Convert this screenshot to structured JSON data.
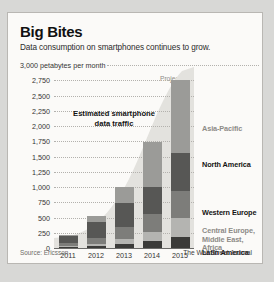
{
  "card": {
    "title": "Big Bites",
    "subtitle": "Data consumption on smartphones continues to grow.",
    "source": "Source: Ericsson",
    "credit": "The Wall Street Journal"
  },
  "annotations": {
    "estimate_note": "Estimated\nsmartphone data\ntraffic",
    "projected": "Projected",
    "axis_unit": "3,000 petabytes per month"
  },
  "colors": {
    "asia_pacific": "#9b9b98",
    "north_america": "#575755",
    "western_europe": "#7d7d7a",
    "cemea": "#b4b4b1",
    "latin_america": "#3b3b39",
    "area_fill": "#e3e2de",
    "card_bg": "#fbfaf8",
    "label_dark": "#141413",
    "label_gray": "#8d8b87"
  },
  "chart_data": {
    "type": "bar",
    "title": "Big Bites",
    "subtitle": "Data consumption on smartphones continues to grow.",
    "xlabel": "",
    "ylabel": "petabytes per month",
    "ylim": [
      0,
      3000
    ],
    "ytick_step": 250,
    "grid": true,
    "stacked": true,
    "legend_position": "right",
    "categories": [
      "2011",
      "2012",
      "2013",
      "2014",
      "2015"
    ],
    "ytick_labels": [
      "0",
      "250",
      "500",
      "750",
      "1,000",
      "1,250",
      "1,500",
      "1,750",
      "2,000",
      "2,250",
      "2,500",
      "2,750",
      "3,000 petabytes per month"
    ],
    "series": [
      {
        "name": "Latin America",
        "values": [
          15,
          30,
          60,
          110,
          180
        ]
      },
      {
        "name": "Central Europe, Middle East, Africa",
        "values": [
          20,
          40,
          80,
          150,
          320
        ]
      },
      {
        "name": "Western Europe",
        "values": [
          45,
          100,
          200,
          300,
          430
        ]
      },
      {
        "name": "North America",
        "values": [
          110,
          250,
          390,
          440,
          630
        ]
      },
      {
        "name": "Asia-Pacific",
        "values": [
          30,
          100,
          270,
          740,
          1190
        ]
      }
    ],
    "totals": [
      220,
      520,
      1000,
      1740,
      2750
    ],
    "annotations": [
      {
        "text": "Estimated smartphone data traffic",
        "type": "area-label"
      },
      {
        "text": "Projected",
        "type": "column-note",
        "category": "2015"
      }
    ]
  },
  "right_labels": [
    {
      "name": "Asia-Pacific",
      "style": "gray"
    },
    {
      "name": "North America",
      "style": "dark"
    },
    {
      "name": "Western Europe",
      "style": "dark"
    },
    {
      "name": "Central Europe,\nMiddle East, Africa",
      "style": "gray"
    },
    {
      "name": "Latin America",
      "style": "dark"
    }
  ]
}
